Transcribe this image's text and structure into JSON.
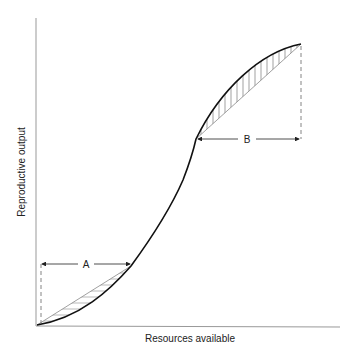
{
  "diagram": {
    "type": "sigmoid-curve",
    "x_axis_label": "Resources available",
    "y_axis_label": "Reproductive output",
    "annotations": [
      {
        "id": "A",
        "label": "A",
        "hatch": "horizontal",
        "region": "lower convex segment"
      },
      {
        "id": "B",
        "label": "B",
        "hatch": "vertical",
        "region": "upper concave segment"
      }
    ],
    "colors": {
      "curve": "#111111",
      "axis": "#888888",
      "hatch": "#777777",
      "text": "#222222"
    }
  }
}
